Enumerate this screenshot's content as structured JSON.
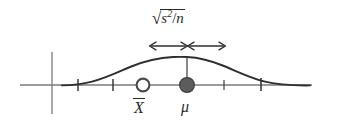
{
  "figure": {
    "type": "statistics-sampling-distribution-diagram",
    "background_color": "#ffffff",
    "stroke_color": "#3a3a3a",
    "axis_color": "#6e6e6e",
    "text_color": "#2b2b2b",
    "labels": {
      "standard_error": {
        "radical": "√",
        "numerator": "s",
        "exponent": "2",
        "slash": "/",
        "denominator": "n",
        "plain": "√(s²/n)"
      },
      "sample_mean": {
        "symbol": "X",
        "accent": "bar",
        "plain": "X̄"
      },
      "population_mean": {
        "symbol": "μ",
        "plain": "μ"
      }
    },
    "markers": [
      {
        "name": "sample-mean-marker",
        "style": "open-circle",
        "label": "X̄",
        "x": 143,
        "y": 85
      },
      {
        "name": "population-mean-marker",
        "style": "filled-circle",
        "label": "μ",
        "x": 187,
        "y": 85
      }
    ],
    "arrows": {
      "name": "standard-error-span",
      "style": "double-headed",
      "segments": [
        {
          "name": "left-arrow",
          "from_x": 150,
          "to_x": 186,
          "y": 46
        },
        {
          "name": "right-arrow",
          "from_x": 188,
          "to_x": 225,
          "y": 46
        }
      ]
    },
    "axes": {
      "horizontal": {
        "x1": 20,
        "x2": 312,
        "y": 85
      },
      "vertical": {
        "x": 52,
        "y1": 52,
        "y2": 114
      },
      "ticks_x": [
        78,
        113,
        224,
        261
      ]
    },
    "curve": {
      "name": "bell-curve",
      "peak_x": 187,
      "peak_y": 57,
      "baseline_y": 85,
      "left_x": 64,
      "right_x": 310
    }
  }
}
